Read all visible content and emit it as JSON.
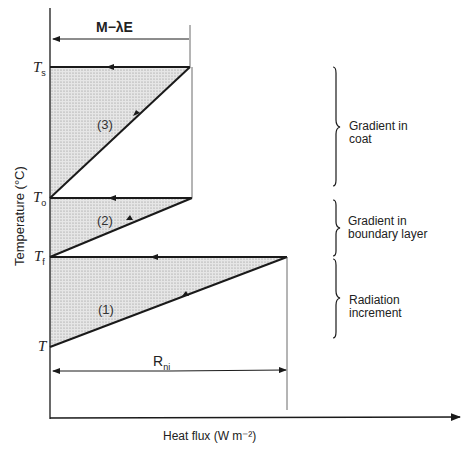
{
  "diagram": {
    "y_axis_label": "Temperature (°C)",
    "x_axis_label": "Heat flux (W m⁻²)",
    "top_span_label": "M−λE",
    "bottom_span_label_main": "R",
    "bottom_span_label_sub": "ni",
    "temperature_levels": [
      {
        "main": "T",
        "sub": "s"
      },
      {
        "main": "T",
        "sub": "o"
      },
      {
        "main": "T",
        "sub": "f"
      },
      {
        "main": "T",
        "sub": ""
      }
    ],
    "segments": [
      "(3)",
      "(2)",
      "(1)"
    ],
    "brace_labels": [
      {
        "line1": "Gradient in",
        "line2": "coat"
      },
      {
        "line1": "Gradient in",
        "line2": "boundary layer"
      },
      {
        "line1": "Radiation",
        "line2": "increment"
      }
    ],
    "colors": {
      "line": "#1a1a1a",
      "shade": "#d8d8d8"
    }
  }
}
